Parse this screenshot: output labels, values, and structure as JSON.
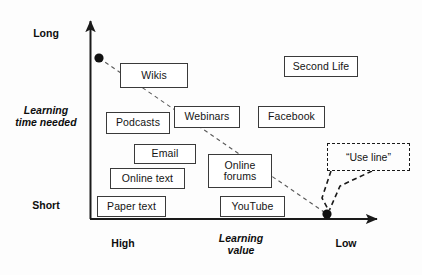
{
  "diagram": {
    "type": "2x2-positioning-diagram",
    "background_color": "#fdfdfd",
    "line_color": "#1a1a1a",
    "box_border_color": "#3a3a3a",
    "box_fill_color": "#ffffff"
  },
  "axes": {
    "y": {
      "label": "Learning\ntime needed",
      "high_tick": "Long",
      "low_tick": "Short",
      "x_px": 90,
      "top_px": 14,
      "bottom_px": 219
    },
    "x": {
      "label": "Learning\nvalue",
      "left_tick": "High",
      "right_tick": "Low",
      "y_px": 219,
      "left_px": 90,
      "right_px": 384
    }
  },
  "trend_line": {
    "name": "use-line",
    "style": "dashed",
    "start": {
      "x": 99,
      "y": 58
    },
    "end": {
      "x": 327,
      "y": 214
    },
    "endpoint_marker": "filled-circle"
  },
  "callout": {
    "label": "“Use line”",
    "style": "dashed-box",
    "box": {
      "x": 327,
      "y": 143,
      "w": 83,
      "h": 28
    },
    "leader_lines": 2
  },
  "nodes": [
    {
      "label": "Wikis",
      "x": 120,
      "y": 63,
      "w": 68,
      "h": 25,
      "learning_value": "high",
      "learning_time": "long"
    },
    {
      "label": "Podcasts",
      "x": 106,
      "y": 112,
      "w": 64,
      "h": 22,
      "learning_value": "high",
      "learning_time": "medium-high"
    },
    {
      "label": "Webinars",
      "x": 174,
      "y": 106,
      "w": 66,
      "h": 22,
      "learning_value": "medium-high",
      "learning_time": "medium-high"
    },
    {
      "label": "Email",
      "x": 134,
      "y": 144,
      "w": 62,
      "h": 20,
      "learning_value": "high",
      "learning_time": "medium"
    },
    {
      "label": "Online text",
      "x": 110,
      "y": 168,
      "w": 75,
      "h": 21,
      "learning_value": "high",
      "learning_time": "medium-low"
    },
    {
      "label": "Online\nforums",
      "x": 208,
      "y": 154,
      "w": 64,
      "h": 34,
      "learning_value": "medium",
      "learning_time": "medium-low"
    },
    {
      "label": "Paper text",
      "x": 97,
      "y": 196,
      "w": 69,
      "h": 21,
      "learning_value": "high",
      "learning_time": "short"
    },
    {
      "label": "YouTube",
      "x": 220,
      "y": 196,
      "w": 65,
      "h": 21,
      "learning_value": "medium",
      "learning_time": "short"
    },
    {
      "label": "Second Life",
      "x": 284,
      "y": 56,
      "w": 74,
      "h": 21,
      "learning_value": "low",
      "learning_time": "long"
    },
    {
      "label": "Facebook",
      "x": 258,
      "y": 106,
      "w": 67,
      "h": 22,
      "learning_value": "low",
      "learning_time": "medium-high"
    }
  ],
  "tick_positions": {
    "long": {
      "x": 18,
      "y": 27,
      "w": 56
    },
    "time": {
      "x": 5,
      "y": 104,
      "w": 82
    },
    "short": {
      "x": 18,
      "y": 199,
      "w": 56
    },
    "high": {
      "x": 95,
      "y": 237,
      "w": 56
    },
    "value": {
      "x": 205,
      "y": 232,
      "w": 72
    },
    "low": {
      "x": 320,
      "y": 237,
      "w": 52
    }
  }
}
